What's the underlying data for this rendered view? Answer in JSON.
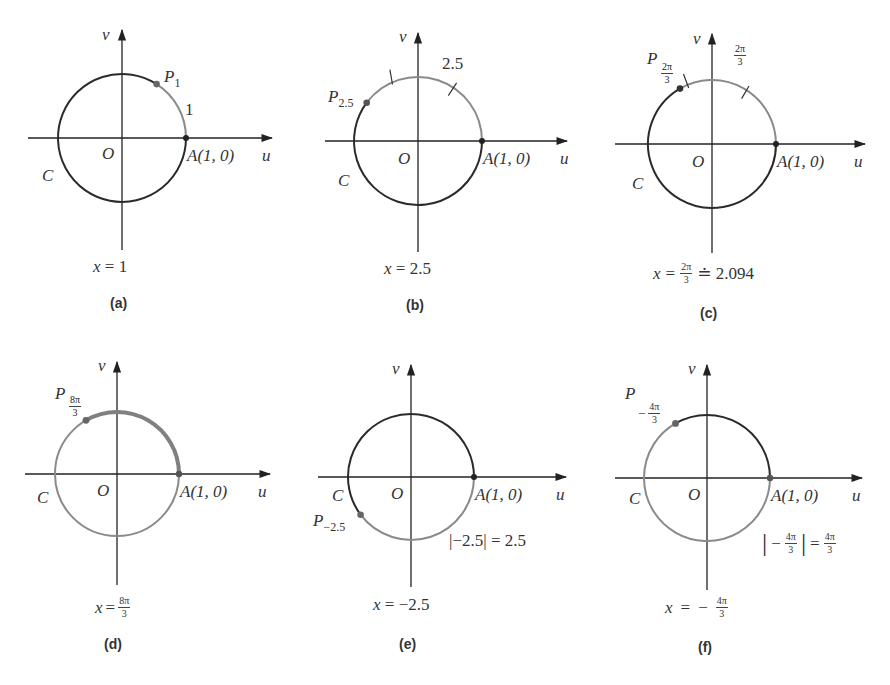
{
  "figure": {
    "colors": {
      "axis": "#222222",
      "arc_dark": "#2a2a2a",
      "arc_gray": "#8a8a8a",
      "point": "#555555"
    },
    "common_labels": {
      "v_axis": "v",
      "u_axis": "u",
      "origin": "O",
      "circle": "C",
      "point_A": "A(1, 0)"
    },
    "panels": [
      {
        "id": "a",
        "letter": "(a)",
        "point_label": "P",
        "point_sub": "1",
        "arc_label": "1",
        "caption_var": "x",
        "caption_eq": "=",
        "caption_value": "1",
        "angle_rad": 1
      },
      {
        "id": "b",
        "letter": "(b)",
        "point_label": "P",
        "point_sub": "2.5",
        "arc_label": "2.5",
        "caption_var": "x",
        "caption_eq": "=",
        "caption_value": "2.5",
        "angle_rad": 2.5
      },
      {
        "id": "c",
        "letter": "(c)",
        "point_label": "P",
        "point_sub_num": "2π",
        "point_sub_den": "3",
        "arc_label_num": "2π",
        "arc_label_den": "3",
        "caption_var": "x",
        "caption_eq": "=",
        "caption_frac_num": "2π",
        "caption_frac_den": "3",
        "caption_approx": "≐ 2.094",
        "angle_rad": 2.094
      },
      {
        "id": "d",
        "letter": "(d)",
        "point_label": "P",
        "point_sub_num": "8π",
        "point_sub_den": "3",
        "caption_var": "x",
        "caption_eq": "=",
        "caption_frac_num": "8π",
        "caption_frac_den": "3",
        "angle_rad": 8.378
      },
      {
        "id": "e",
        "letter": "(e)",
        "point_label": "P",
        "point_sub": "−2.5",
        "abs_label": "|−2.5| = 2.5",
        "caption_var": "x",
        "caption_eq": "=",
        "caption_value": "−2.5",
        "angle_rad": -2.5
      },
      {
        "id": "f",
        "letter": "(f)",
        "point_label": "P",
        "point_sub_sign": "−",
        "point_sub_num": "4π",
        "point_sub_den": "3",
        "abs_bar_left": "|",
        "abs_sign": "−",
        "abs_num": "4π",
        "abs_den": "3",
        "abs_bar_right": "|",
        "abs_eq": "=",
        "abs_rhs_num": "4π",
        "abs_rhs_den": "3",
        "caption_var": "x",
        "caption_eq": "=",
        "caption_sign": "−",
        "caption_frac_num": "4π",
        "caption_frac_den": "3",
        "angle_rad": -4.189
      }
    ]
  }
}
